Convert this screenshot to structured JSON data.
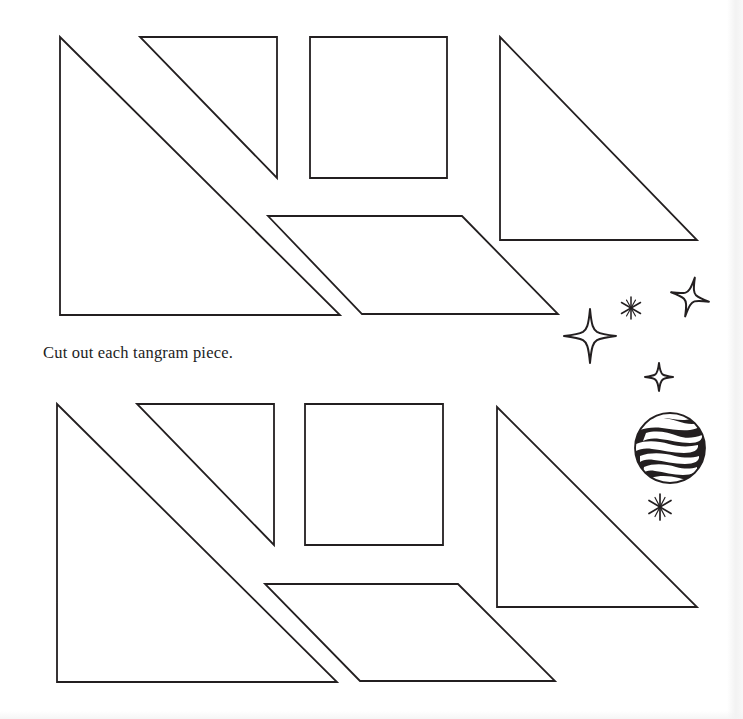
{
  "page": {
    "width": 743,
    "height": 719,
    "background_color": "#ffffff",
    "ink_color": "#231f20",
    "stroke_width": 1.6
  },
  "instruction": {
    "text": "Cut out each tangram piece.",
    "x": 43,
    "y": 343,
    "font_size": 16.5
  },
  "tangram_sets": [
    {
      "name": "top-tangram-set",
      "pieces": [
        {
          "name": "large-triangle-left",
          "shape": "triangle",
          "points": "60,37 60,315 340,315"
        },
        {
          "name": "medium-triangle-top",
          "shape": "triangle",
          "points": "140,37 277,37 277,178"
        },
        {
          "name": "square",
          "shape": "square",
          "points": "310,37 447,37 447,178 310,178"
        },
        {
          "name": "large-triangle-right",
          "shape": "triangle",
          "points": "500,37 697,240 500,240"
        },
        {
          "name": "parallelogram",
          "shape": "parallelogram",
          "points": "268,216 462,216 558,314 362,314"
        }
      ]
    },
    {
      "name": "bottom-tangram-set",
      "pieces": [
        {
          "name": "large-triangle-left",
          "shape": "triangle",
          "points": "57,404 57,682 337,682"
        },
        {
          "name": "medium-triangle-top",
          "shape": "triangle",
          "points": "137,404 274,404 274,545"
        },
        {
          "name": "square",
          "shape": "square",
          "points": "305,404 443,404 443,545 305,545"
        },
        {
          "name": "large-triangle-right",
          "shape": "triangle",
          "points": "497,407 697,607 497,607"
        },
        {
          "name": "parallelogram",
          "shape": "parallelogram",
          "points": "265,584 458,584 555,681 360,681"
        }
      ]
    }
  ],
  "decorations": [
    {
      "name": "sparkle-star-large",
      "type": "four-point-star",
      "cx": 590,
      "cy": 336,
      "size": 27
    },
    {
      "name": "sparkle-star-upper-right",
      "type": "four-point-star",
      "cx": 690,
      "cy": 297,
      "size": 20
    },
    {
      "name": "sparkle-star-small",
      "type": "four-point-star",
      "cx": 659,
      "cy": 377,
      "size": 14
    },
    {
      "name": "sparkle-asterisk-upper",
      "type": "asterisk-sparkle",
      "cx": 631,
      "cy": 308,
      "size": 11
    },
    {
      "name": "sparkle-asterisk-lower",
      "type": "asterisk-sparkle",
      "cx": 660,
      "cy": 507,
      "size": 13
    },
    {
      "name": "planet",
      "type": "striped-planet",
      "cx": 670,
      "cy": 448,
      "r": 36
    }
  ]
}
